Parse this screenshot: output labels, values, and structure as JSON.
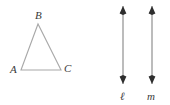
{
  "figure": {
    "background_color": "#ffffff",
    "width": 170,
    "height": 105,
    "stroke_color_triangle": "#a8a8a8",
    "stroke_color_line": "#8f8f8f",
    "arrowhead_color": "#2e2e2e",
    "label_color": "#3a3a3a"
  },
  "triangle": {
    "name": "triangle-ABC",
    "vertices": [
      {
        "id": "A",
        "label": "A",
        "x": 21,
        "y": 70,
        "label_x": 10,
        "label_y": 73
      },
      {
        "id": "B",
        "label": "B",
        "x": 38,
        "y": 24,
        "label_x": 35,
        "label_y": 19
      },
      {
        "id": "C",
        "label": "C",
        "x": 61,
        "y": 70,
        "label_x": 64,
        "label_y": 72
      }
    ],
    "sides": [
      {
        "from": "A",
        "to": "B"
      },
      {
        "from": "B",
        "to": "C"
      },
      {
        "from": "C",
        "to": "A"
      }
    ]
  },
  "lines": [
    {
      "id": "l",
      "label": "ℓ",
      "x": 123,
      "y_top": 6,
      "y_bottom": 84,
      "label_x": 120,
      "label_y": 100,
      "double_headed": true
    },
    {
      "id": "m",
      "label": "m",
      "x": 152,
      "y_top": 6,
      "y_bottom": 84,
      "label_x": 147,
      "label_y": 100,
      "double_headed": true
    }
  ]
}
